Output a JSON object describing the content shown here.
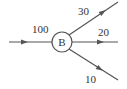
{
  "diagram": {
    "type": "flow-split",
    "node": {
      "label": "B"
    },
    "edges": [
      {
        "id": "in",
        "direction": "incoming",
        "value": "100"
      },
      {
        "id": "out-upper",
        "direction": "outgoing",
        "value": "30"
      },
      {
        "id": "out-middle",
        "direction": "outgoing",
        "value": "20"
      },
      {
        "id": "out-lower",
        "direction": "outgoing",
        "value": "10"
      }
    ],
    "colors": {
      "stroke": "#555555",
      "text": "#333333",
      "background": "#ffffff"
    }
  }
}
